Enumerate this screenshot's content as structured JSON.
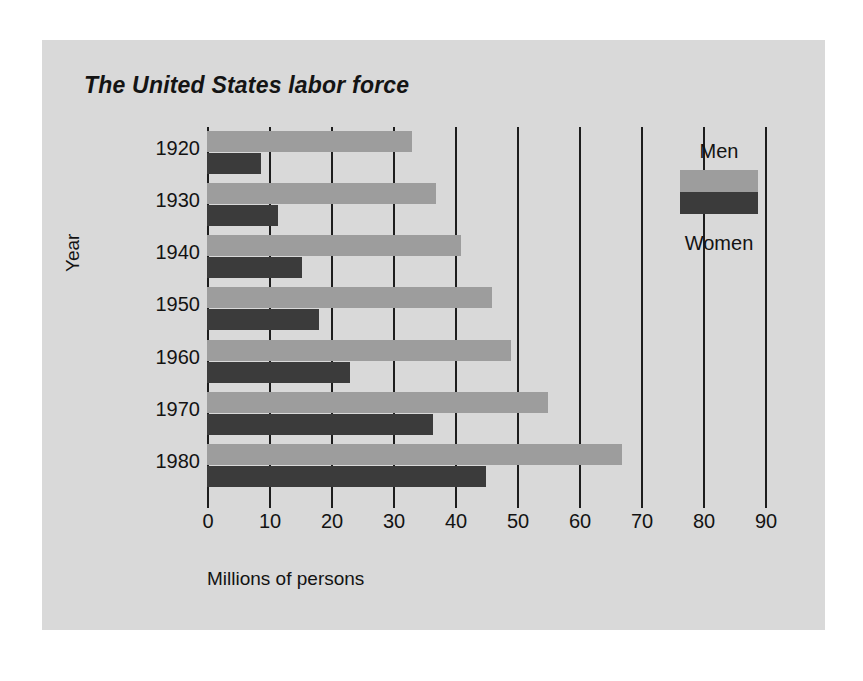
{
  "chart_data": {
    "type": "bar",
    "orientation": "horizontal",
    "title": "The United States labor force",
    "xlabel": "Millions of persons",
    "ylabel": "Year",
    "categories": [
      "1920",
      "1930",
      "1940",
      "1950",
      "1960",
      "1970",
      "1980"
    ],
    "series": [
      {
        "name": "Men",
        "values": [
          33,
          37,
          41,
          46,
          49,
          55,
          67
        ],
        "color": "#9d9d9d"
      },
      {
        "name": "Women",
        "values": [
          8.7,
          11.5,
          15.3,
          18,
          23,
          36.5,
          45
        ],
        "color": "#3b3b3b"
      }
    ],
    "xlim": [
      0,
      90
    ],
    "xticks": [
      "0",
      "10",
      "20",
      "30",
      "40",
      "50",
      "60",
      "70",
      "80",
      "90"
    ],
    "grid": true,
    "legend_position": "inside-right"
  },
  "legend": {
    "men_label": "Men",
    "women_label": "Women"
  },
  "colors": {
    "page_background": "#ffffff",
    "panel_background": "#d9d9d9",
    "men_bar": "#9d9d9d",
    "women_bar": "#3b3b3b",
    "gridline": "#1d1d1d",
    "text": "#131313"
  }
}
